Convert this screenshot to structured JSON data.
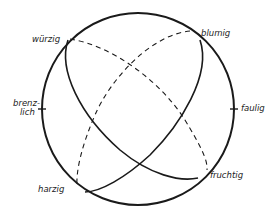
{
  "diagram": {
    "type": "aroma sphere",
    "colors": {
      "stroke": "#1a1a1a",
      "background": "#ffffff"
    },
    "labels": {
      "wuerzig": "würzig",
      "blumig": "blumig",
      "brenz_line1": "brenz-",
      "brenz_line2": "lich",
      "faulig": "faulig",
      "harzig": "harzig",
      "fruchtig": "fruchtig"
    }
  }
}
